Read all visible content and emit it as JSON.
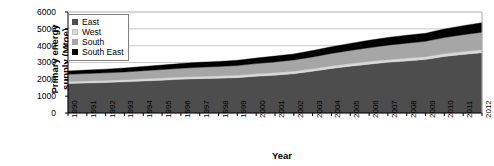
{
  "chart_data": {
    "type": "area",
    "stacked": true,
    "title": "",
    "xlabel": "Year",
    "ylabel": "Primary energy supply (Mtoe)",
    "ylabel_lines": [
      "Primary energy",
      "supply (Mtoe)"
    ],
    "ylim": [
      0,
      6000
    ],
    "ytick_labels": [
      "0",
      "1000",
      "2000",
      "3000",
      "4000",
      "5000",
      "6000"
    ],
    "ytick_values": [
      0,
      1000,
      2000,
      3000,
      4000,
      5000,
      6000
    ],
    "grid": true,
    "grid_axis": "y",
    "legend_position": "top-left",
    "categories": [
      1990,
      1991,
      1992,
      1993,
      1994,
      1995,
      1996,
      1997,
      1998,
      1999,
      2000,
      2001,
      2002,
      2003,
      2004,
      2005,
      2006,
      2007,
      2008,
      2009,
      2010,
      2011,
      2012
    ],
    "xtick_labels": [
      "1990",
      "1991",
      "1992",
      "1993",
      "1994",
      "1995",
      "1996",
      "1997",
      "1998",
      "1999",
      "2000",
      "2001",
      "2002",
      "2003",
      "2004",
      "2005",
      "2006",
      "2007",
      "2008",
      "2009",
      "2010",
      "2011",
      "2012"
    ],
    "series": [
      {
        "name": "East",
        "color": "#4d4d4d",
        "values": [
          1750,
          1780,
          1810,
          1850,
          1900,
          1950,
          2000,
          2040,
          2060,
          2100,
          2180,
          2250,
          2330,
          2480,
          2640,
          2780,
          2900,
          3010,
          3090,
          3180,
          3350,
          3480,
          3580
        ]
      },
      {
        "name": "West",
        "color": "#d9d9d9",
        "values": [
          120,
          120,
          125,
          125,
          130,
          130,
          135,
          135,
          140,
          140,
          145,
          145,
          150,
          150,
          155,
          155,
          160,
          160,
          165,
          165,
          170,
          170,
          175
        ]
      },
      {
        "name": "South",
        "color": "#a6a6a6",
        "values": [
          430,
          440,
          450,
          460,
          480,
          500,
          520,
          540,
          560,
          580,
          610,
          640,
          670,
          700,
          740,
          780,
          820,
          860,
          890,
          910,
          960,
          1000,
          1040
        ]
      },
      {
        "name": "South East",
        "color": "#000000",
        "values": [
          200,
          210,
          220,
          235,
          250,
          265,
          285,
          300,
          300,
          310,
          330,
          345,
          360,
          380,
          400,
          420,
          440,
          460,
          475,
          480,
          510,
          540,
          570
        ]
      }
    ],
    "totals": [
      2500,
      2550,
      2605,
      2670,
      2760,
      2845,
      2940,
      3015,
      3060,
      3130,
      3265,
      3380,
      3510,
      3710,
      3935,
      4135,
      4320,
      4490,
      4620,
      4735,
      4990,
      5190,
      5365
    ]
  },
  "legend": {
    "items": [
      {
        "label": "East",
        "color": "#4d4d4d"
      },
      {
        "label": "West",
        "color": "#d9d9d9"
      },
      {
        "label": "South",
        "color": "#a6a6a6"
      },
      {
        "label": "South East",
        "color": "#000000"
      }
    ]
  },
  "colors": {
    "background": "#ffffff",
    "axis": "#000000",
    "gridline": "#c8c8c8",
    "legend_border": "#808080"
  }
}
